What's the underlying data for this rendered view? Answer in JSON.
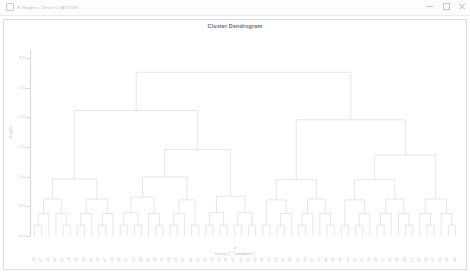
{
  "window": {
    "title": "R Graphics: Device 2 (ACTIVE)",
    "icon": "r-app-icon",
    "controls": [
      {
        "name": "minimize-button",
        "glyph": "minimize"
      },
      {
        "name": "maximize-button",
        "glyph": "maximize"
      },
      {
        "name": "close-button",
        "glyph": "close"
      }
    ]
  },
  "chart_data": {
    "type": "dendrogram",
    "title": "Cluster Dendrogram",
    "xlabel_line1": "d",
    "xlabel_line2": "hclust (*, \"complete\")",
    "ylabel": "Height",
    "ylim": [
      0.0,
      3.0
    ],
    "yticks": [
      0.0,
      0.5,
      1.0,
      1.5,
      2.0,
      2.5,
      3.0
    ],
    "ytick_labels": [
      "0.0",
      "0.5",
      "1.0",
      "1.5",
      "2.0",
      "2.5",
      "3.0"
    ],
    "grid": false,
    "legend": "none",
    "linkage": "complete",
    "n_leaves": 60,
    "root_height": 2.76,
    "leaf_order": [
      "s14",
      "s27",
      "s41",
      "s03",
      "s52",
      "s18",
      "s36",
      "s09",
      "s45",
      "s21",
      "s07",
      "s33",
      "s50",
      "s12",
      "s29",
      "s44",
      "s01",
      "s58",
      "s25",
      "s38",
      "s16",
      "s47",
      "s05",
      "s31",
      "s53",
      "s10",
      "s23",
      "s40",
      "s19",
      "s56",
      "s02",
      "s35",
      "s48",
      "s13",
      "s28",
      "s42",
      "s06",
      "s51",
      "s24",
      "s37",
      "s17",
      "s46",
      "s08",
      "s30",
      "s54",
      "s11",
      "s22",
      "s39",
      "s20",
      "s57",
      "s04",
      "s34",
      "s49",
      "s15",
      "s26",
      "s43",
      "s32",
      "s55",
      "s59",
      "s60"
    ],
    "merges": [
      {
        "id": 1,
        "left": "s14",
        "right": "s27",
        "height": 0.22
      },
      {
        "id": 2,
        "left": "s41",
        "right": "s03",
        "height": 0.2
      },
      {
        "id": 3,
        "left": "s52",
        "right": "s18",
        "height": 0.3
      },
      {
        "id": 4,
        "left": "s36",
        "right": "s09",
        "height": 0.26
      },
      {
        "id": 5,
        "left": "s45",
        "right": "s21",
        "height": 0.18
      },
      {
        "id": 6,
        "left": "s07",
        "right": "s33",
        "height": 0.33
      },
      {
        "id": 7,
        "left": "s50",
        "right": "s12",
        "height": 0.24
      },
      {
        "id": 8,
        "left": "s29",
        "right": "s44",
        "height": 0.28
      },
      {
        "id": 9,
        "left": "s01",
        "right": "s58",
        "height": 0.21
      },
      {
        "id": 10,
        "left": "s25",
        "right": "s38",
        "height": 0.35
      },
      {
        "id": 11,
        "left": "s16",
        "right": "s47",
        "height": 0.19
      },
      {
        "id": 12,
        "left": "s05",
        "right": "s31",
        "height": 0.27
      },
      {
        "id": 13,
        "left": "s53",
        "right": "s10",
        "height": 0.23
      },
      {
        "id": 14,
        "left": "s23",
        "right": "s40",
        "height": 0.31
      },
      {
        "id": 15,
        "left": "s19",
        "right": "s56",
        "height": 0.25
      },
      {
        "id": 16,
        "left": "s02",
        "right": "s35",
        "height": 0.29
      },
      {
        "id": 17,
        "left": "s48",
        "right": "s13",
        "height": 0.22
      },
      {
        "id": 18,
        "left": "s28",
        "right": "s42",
        "height": 0.34
      },
      {
        "id": 19,
        "left": "s06",
        "right": "s51",
        "height": 0.26
      },
      {
        "id": 20,
        "left": "s24",
        "right": "s37",
        "height": 0.2
      },
      {
        "id": 21,
        "left": "s17",
        "right": "s46",
        "height": 0.32
      },
      {
        "id": 22,
        "left": "s08",
        "right": "s30",
        "height": 0.24
      },
      {
        "id": 23,
        "left": "s54",
        "right": "s11",
        "height": 0.28
      },
      {
        "id": 24,
        "left": "s22",
        "right": "s39",
        "height": 0.21
      },
      {
        "id": 25,
        "left": "s20",
        "right": "s57",
        "height": 0.36
      },
      {
        "id": 26,
        "left": "s04",
        "right": "s34",
        "height": 0.23
      },
      {
        "id": 27,
        "left": "s49",
        "right": "s15",
        "height": 0.3
      },
      {
        "id": 28,
        "left": "s26",
        "right": "s43",
        "height": 0.27
      },
      {
        "id": 29,
        "left": "s32",
        "right": "s55",
        "height": 0.19
      },
      {
        "id": 30,
        "left": "s59",
        "right": "s60",
        "height": 0.88
      },
      {
        "id": 31,
        "left": "c1",
        "right": "c2",
        "height": 0.62
      },
      {
        "id": 32,
        "left": "c3",
        "right": "c4",
        "height": 0.55
      },
      {
        "id": 33,
        "left": "c5",
        "right": "c6",
        "height": 0.7
      },
      {
        "id": 34,
        "left": "c7",
        "right": "c8",
        "height": 0.58
      },
      {
        "id": 35,
        "left": "c9",
        "right": "c10",
        "height": 0.66
      },
      {
        "id": 36,
        "left": "c11",
        "right": "c12",
        "height": 0.52
      },
      {
        "id": 37,
        "left": "c13",
        "right": "c14",
        "height": 0.74
      },
      {
        "id": 38,
        "left": "c15",
        "right": "c16",
        "height": 0.6
      },
      {
        "id": 39,
        "left": "c17",
        "right": "c18",
        "height": 0.68
      },
      {
        "id": 40,
        "left": "c19",
        "right": "c20",
        "height": 0.95
      },
      {
        "id": 41,
        "left": "m31",
        "right": "m32",
        "height": 1.12
      },
      {
        "id": 42,
        "left": "m33",
        "right": "m34",
        "height": 1.05
      },
      {
        "id": 43,
        "left": "m35",
        "right": "m36",
        "height": 1.22
      },
      {
        "id": 44,
        "left": "m37",
        "right": "m38",
        "height": 1.3
      },
      {
        "id": 45,
        "left": "m39",
        "right": "m40",
        "height": 1.45
      },
      {
        "id": 46,
        "left": "m41",
        "right": "m42",
        "height": 1.58
      },
      {
        "id": 47,
        "left": "m43",
        "right": "m44",
        "height": 1.72
      },
      {
        "id": 48,
        "left": "m45",
        "right": "m46",
        "height": 1.88
      },
      {
        "id": 49,
        "left": "m47",
        "right": "m48",
        "height": 2.05
      },
      {
        "id": 50,
        "left": "m49",
        "right": "m50",
        "height": 2.2
      },
      {
        "id": 51,
        "left": "m51",
        "right": "m52",
        "height": 2.38
      },
      {
        "id": 52,
        "left": "m53",
        "right": "m54",
        "height": 2.76
      }
    ]
  }
}
